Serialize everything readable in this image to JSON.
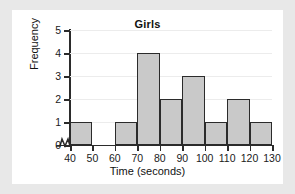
{
  "chart_data": {
    "type": "bar",
    "title": "Girls",
    "xlabel": "Time (seconds)",
    "ylabel": "Frequency",
    "bin_edges": [
      40,
      50,
      60,
      70,
      80,
      90,
      100,
      110,
      120,
      130
    ],
    "categories": [
      "40-50",
      "50-60",
      "60-70",
      "70-80",
      "80-90",
      "90-100",
      "100-110",
      "110-120",
      "120-130"
    ],
    "values": [
      1,
      0,
      1,
      4,
      2,
      3,
      1,
      2,
      1
    ],
    "xtick_labels": [
      "40",
      "50",
      "60",
      "70",
      "80",
      "90",
      "100",
      "110",
      "120",
      "130"
    ],
    "ytick_labels": [
      "0",
      "1",
      "2",
      "3",
      "4",
      "5"
    ],
    "xlim": [
      40,
      130
    ],
    "ylim": [
      0,
      5
    ],
    "grid": true,
    "legend": null,
    "axis_break": "x-axis-break-zigzag",
    "bar_fill_color": "#c9c9c9",
    "bar_edge_color": "#2b2b2b",
    "axis_color": "#2b2b2b",
    "gridline_color": "#ececec",
    "background_color": "#ffffff",
    "page_background_color": "#e8e8e8"
  }
}
